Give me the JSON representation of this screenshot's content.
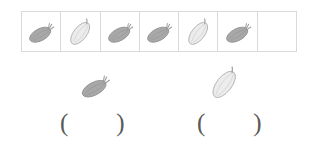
{
  "worksheet": {
    "type": "counting-worksheet",
    "table": {
      "name": "vegetable-count-table",
      "columns": 7,
      "cells": [
        {
          "index": 1,
          "item": "squash",
          "filled": true
        },
        {
          "index": 2,
          "item": "melon",
          "filled": true
        },
        {
          "index": 3,
          "item": "squash",
          "filled": true
        },
        {
          "index": 4,
          "item": "squash",
          "filled": true
        },
        {
          "index": 5,
          "item": "melon",
          "filled": true
        },
        {
          "index": 6,
          "item": "squash",
          "filled": true
        },
        {
          "index": 7,
          "item": "",
          "filled": false
        }
      ]
    },
    "prompts": [
      {
        "index": 1,
        "item": "squash",
        "icon": "squash-icon"
      },
      {
        "index": 2,
        "item": "melon",
        "icon": "melon-icon"
      }
    ],
    "answers": [
      {
        "index": 1,
        "open_paren": "(",
        "value": "",
        "close_paren": ")"
      },
      {
        "index": 2,
        "open_paren": "(",
        "value": "",
        "close_paren": ")"
      }
    ],
    "colors": {
      "grid_line": "#d9d9d9",
      "squash_fill": "#a8a8a8",
      "squash_outline": "#8f8f8f",
      "melon_fill": "#ececec",
      "melon_outline": "#b4b4b4",
      "paren_text": "#5a5a5a",
      "background": "#ffffff"
    }
  }
}
